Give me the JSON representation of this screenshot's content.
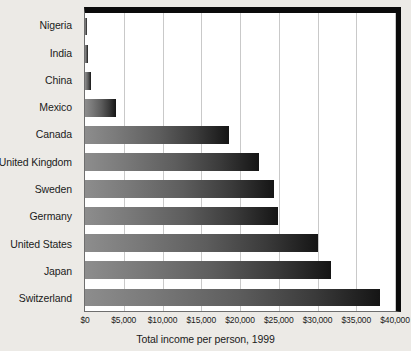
{
  "chart_data": {
    "type": "bar",
    "orientation": "horizontal",
    "title": "",
    "xlabel": "Total income per person, 1999",
    "ylabel": "",
    "categories": [
      "Nigeria",
      "India",
      "China",
      "Mexico",
      "Canada",
      "United Kingdom",
      "Sweden",
      "Germany",
      "United States",
      "Japan",
      "Switzerland"
    ],
    "values": [
      250,
      450,
      780,
      4000,
      18600,
      22400,
      24400,
      24900,
      30000,
      31800,
      38000
    ],
    "xlim": [
      0,
      40000
    ],
    "xticks": [
      0,
      5000,
      10000,
      15000,
      20000,
      25000,
      30000,
      35000,
      40000
    ],
    "xticklabels": [
      "$0",
      "$5,000",
      "$10,000",
      "$15,000",
      "$20,000",
      "$25,000",
      "$30,000",
      "$35,000",
      "$40,000"
    ],
    "grid": "vertical",
    "legend": null,
    "bar_color_start": "#8d8d8d",
    "bar_color_end": "#151515",
    "plot_background": "#ffffff",
    "figure_background": "#eceae6",
    "border_color": "#0b0b0b"
  }
}
